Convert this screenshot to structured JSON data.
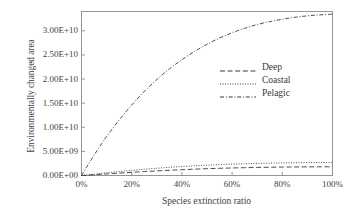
{
  "chart_data": {
    "type": "line",
    "title": "",
    "xlabel": "Species extinction ratio",
    "ylabel": "Environmentally changed area",
    "xlim": [
      0,
      100
    ],
    "ylim": [
      0,
      34000000000
    ],
    "grid": false,
    "legend_position": "center-right",
    "xticks": [
      "0%",
      "20%",
      "40%",
      "60%",
      "80%",
      "100%"
    ],
    "xtick_values": [
      0,
      20,
      40,
      60,
      80,
      100
    ],
    "yticks": [
      "0.00E+00",
      "5.00E+09",
      "1.00E+10",
      "1.50E+10",
      "2.00E+10",
      "2.50E+10",
      "3.00E+10"
    ],
    "ytick_values": [
      0,
      5000000000,
      10000000000,
      15000000000,
      20000000000,
      25000000000,
      30000000000
    ],
    "x": [
      0,
      2,
      5,
      8,
      10,
      15,
      20,
      25,
      30,
      35,
      40,
      45,
      50,
      55,
      60,
      65,
      70,
      75,
      80,
      85,
      90,
      95,
      100
    ],
    "series": [
      {
        "name": "Deep",
        "style": "dashed",
        "color": "#3a3a3a",
        "values": [
          0,
          60000000,
          160000000,
          260000000,
          330000000,
          500000000,
          660000000,
          810000000,
          950000000,
          1080000000,
          1200000000,
          1310000000,
          1410000000,
          1490000000,
          1560000000,
          1620000000,
          1670000000,
          1710000000,
          1745000000,
          1770000000,
          1790000000,
          1805000000,
          1815000000
        ]
      },
      {
        "name": "Coastal",
        "style": "dotted",
        "color": "#3a3a3a",
        "values": [
          0,
          110000000,
          280000000,
          440000000,
          550000000,
          810000000,
          1060000000,
          1290000000,
          1500000000,
          1690000000,
          1860000000,
          2010000000,
          2140000000,
          2260000000,
          2360000000,
          2440000000,
          2510000000,
          2560000000,
          2610000000,
          2650000000,
          2680000000,
          2700000000,
          2720000000
        ]
      },
      {
        "name": "Pelagic",
        "style": "dash-dot",
        "color": "#3a3a3a",
        "values": [
          0,
          1700000000,
          4200000000,
          6600000000,
          8100000000,
          11500000000,
          14600000000,
          17400000000,
          19900000000,
          22100000000,
          24000000000,
          25700000000,
          27200000000,
          28500000000,
          29600000000,
          30500000000,
          31300000000,
          31900000000,
          32400000000,
          32800000000,
          33100000000,
          33300000000,
          33450000000
        ]
      }
    ]
  },
  "legend": {
    "items": [
      {
        "label": "Deep"
      },
      {
        "label": "Coastal"
      },
      {
        "label": "Pelagic"
      }
    ]
  }
}
